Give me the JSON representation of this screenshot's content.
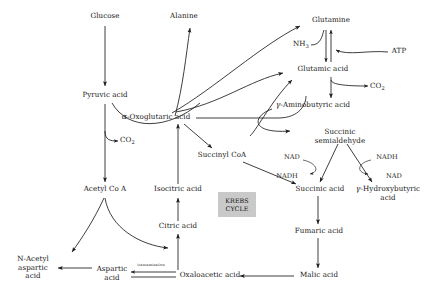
{
  "diagram": {
    "background_color": "#ffffff",
    "line_color": "#1c1c1c",
    "krebs_box_color": "#c9c9c9"
  },
  "nodes": {
    "glucose": {
      "label": "Glucose",
      "x": 105,
      "y": 18
    },
    "pyruvic_acid": {
      "label": "Pyruvic acid",
      "x": 105,
      "y": 97
    },
    "co2_pyruvate": {
      "label": "CO",
      "sub": "2",
      "x": 107,
      "y": 140
    },
    "acetyl_coa": {
      "label": "Acetyl Co A",
      "x": 104,
      "y": 190
    },
    "n_acetyl_aspartic_acid": {
      "line1": "N-Acetyl",
      "line2": "aspartic",
      "line3": "acid",
      "x": 33,
      "y": 263
    },
    "aspartic_acid": {
      "line1": "Aspartic",
      "line2": "acid",
      "x": 112,
      "y": 268
    },
    "transamination": {
      "label": "transamination",
      "x": 150,
      "y": 264
    },
    "oxaloacetic_acid": {
      "label": "Oxaloacetic acid",
      "x": 200,
      "y": 276
    },
    "citric_acid": {
      "label": "Citric acid",
      "x": 178,
      "y": 227
    },
    "isocitric_acid": {
      "label": "Isocitric acid",
      "x": 178,
      "y": 190
    },
    "alpha_oxoglutaric_acid": {
      "greek": "α",
      "label": "-Oxoglutaric acid",
      "x": 148,
      "y": 118
    },
    "alanine": {
      "label": "Alanine",
      "x": 183,
      "y": 18
    },
    "glutamine": {
      "label": "Glutamine",
      "x": 330,
      "y": 22
    },
    "nh3": {
      "label": "NH",
      "sub": "3",
      "x": 298,
      "y": 45
    },
    "atp": {
      "label": "ATP",
      "x": 398,
      "y": 52
    },
    "glutamic_acid": {
      "label": "Glutamic acid",
      "x": 318,
      "y": 70
    },
    "co2_glutamate": {
      "label": "CO",
      "sub": "2",
      "x": 385,
      "y": 86
    },
    "gamma_aminobutyric_acid": {
      "greek": "γ",
      "label": "-Aminobutyric acid",
      "x": 296,
      "y": 106
    },
    "succinic_semialdehyde": {
      "line1": "Succinic",
      "line2": "semialdehyde",
      "x": 340,
      "y": 135
    },
    "nad_left": {
      "label": "NAD",
      "x": 292,
      "y": 158
    },
    "nadh_left": {
      "label": "NADH",
      "x": 288,
      "y": 177
    },
    "nadh_right": {
      "label": "NADH",
      "x": 384,
      "y": 158
    },
    "nad_right": {
      "label": "NAD",
      "x": 392,
      "y": 177
    },
    "succinyl_coa": {
      "label": "Succinyl CoA",
      "x": 221,
      "y": 156
    },
    "succinic_acid": {
      "label": "Succinic acid",
      "x": 318,
      "y": 190
    },
    "gamma_hydroxybutyric_acid": {
      "greek": "γ",
      "label": "-Hydroxybutyric",
      "line2": "acid",
      "x": 386,
      "y": 190
    },
    "fumaric_acid": {
      "label": "Fumaric acid",
      "x": 318,
      "y": 232
    },
    "malic_acid": {
      "label": "Malic acid",
      "x": 318,
      "y": 276
    },
    "krebs_cycle": {
      "line1": "KREBS",
      "line2": "CYCLE",
      "x": 237,
      "y": 204
    }
  },
  "edges": [
    {
      "name": "glucose-to-pyruvic-acid",
      "type": "arrow-down"
    },
    {
      "name": "pyruvic-acid-to-co2",
      "type": "curve-branch"
    },
    {
      "name": "pyruvic-acid-to-acetyl-coa",
      "type": "arrow-down"
    },
    {
      "name": "pyruvic-acid-to-alpha-oxoglutaric",
      "type": "curve"
    },
    {
      "name": "alpha-oxoglutaric-to-alanine",
      "type": "curve-arrow"
    },
    {
      "name": "alpha-oxoglutaric-to-glutamine",
      "type": "curve-arrow"
    },
    {
      "name": "alpha-oxoglutaric-to-glutamic-acid",
      "type": "curve-arrow"
    },
    {
      "name": "glutamine-glutamic-acid-reversible",
      "type": "double-arrow"
    },
    {
      "name": "nh3-to-reaction",
      "type": "curve"
    },
    {
      "name": "atp-to-reaction",
      "type": "curve"
    },
    {
      "name": "glutamic-acid-to-gaba",
      "type": "arrow-down"
    },
    {
      "name": "glutamic-acid-to-co2",
      "type": "curve-branch"
    },
    {
      "name": "gaba-to-succinic-semialdehyde",
      "type": "curve-arrow"
    },
    {
      "name": "gaba-to-glutamic-acid-back",
      "type": "curve-arrow"
    },
    {
      "name": "succinic-semialdehyde-to-succinic-acid",
      "type": "arrow-diagonal"
    },
    {
      "name": "succinic-semialdehyde-to-gamma-hydroxybutyric",
      "type": "arrow-diagonal"
    },
    {
      "name": "nad-to-nadh-left",
      "type": "cofactor-arc"
    },
    {
      "name": "nadh-to-nad-right",
      "type": "cofactor-arc"
    },
    {
      "name": "alpha-oxoglutaric-to-succinyl-coa",
      "type": "arrow-diagonal"
    },
    {
      "name": "succinyl-coa-to-succinic-acid",
      "type": "arrow-diagonal"
    },
    {
      "name": "alpha-oxoglutaric-to-succinic-semialdehyde-line",
      "type": "line-curve"
    },
    {
      "name": "succinic-acid-to-fumaric-acid",
      "type": "arrow-down"
    },
    {
      "name": "fumaric-acid-to-malic-acid",
      "type": "arrow-down"
    },
    {
      "name": "malic-acid-to-oxaloacetic-acid",
      "type": "arrow-left"
    },
    {
      "name": "oxaloacetic-acid-to-citric-acid",
      "type": "arrow-up"
    },
    {
      "name": "citric-acid-to-isocitric-acid",
      "type": "arrow-up"
    },
    {
      "name": "isocitric-acid-to-alpha-oxoglutaric",
      "type": "arrow-up"
    },
    {
      "name": "oxaloacetic-acid-to-aspartic-acid",
      "type": "double-arrow-horizontal"
    },
    {
      "name": "aspartic-acid-to-n-acetyl-aspartic-acid",
      "type": "arrow-left"
    },
    {
      "name": "acetyl-coa-to-citric-acid",
      "type": "curve-arrow"
    },
    {
      "name": "acetyl-coa-to-n-acetyl-aspartic-acid",
      "type": "curve-arrow"
    }
  ]
}
